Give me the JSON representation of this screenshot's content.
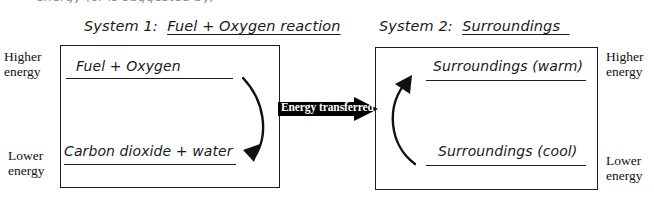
{
  "page": {
    "clipped_top_text": "energy (or is suggested by)"
  },
  "left_system": {
    "title_prefix": "System 1:",
    "title_subject": "Fuel + Oxygen reaction",
    "higher_energy_label": "Higher\nenergy",
    "higher_energy_line1": "Higher",
    "higher_energy_line2": "energy",
    "lower_energy_line1": "Lower",
    "lower_energy_line2": "energy",
    "top_level": "Fuel + Oxygen",
    "bottom_level": "Carbon dioxide + water",
    "arrow_name": "downward-curved-arrow"
  },
  "transfer": {
    "label": "Energy transferred",
    "direction": "left-to-right",
    "color": "#000000",
    "text_color": "#ffffff"
  },
  "right_system": {
    "title_prefix": "System 2:",
    "title_subject": "Surroundings",
    "higher_energy_line1": "Higher",
    "higher_energy_line2": "energy",
    "lower_energy_line1": "Lower",
    "lower_energy_line2": "energy",
    "top_level": "Surroundings (warm)",
    "bottom_level": "Surroundings (cool)",
    "arrow_name": "upward-curved-arrow"
  },
  "colors": {
    "ink": "#1a1a1a",
    "box_border": "#1c1c1c",
    "background": "#ffffff"
  }
}
